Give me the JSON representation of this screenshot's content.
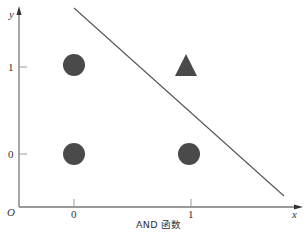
{
  "title": "AND 函数",
  "axes": {
    "x_label": "x",
    "y_label": "y",
    "origin_label": "O",
    "x_ticks": [
      "0",
      "1"
    ],
    "y_ticks": [
      "0",
      "1"
    ]
  },
  "points": [
    {
      "x": 0,
      "y": 0,
      "output": 0,
      "marker": "circle"
    },
    {
      "x": 0,
      "y": 1,
      "output": 0,
      "marker": "circle"
    },
    {
      "x": 1,
      "y": 0,
      "output": 0,
      "marker": "circle"
    },
    {
      "x": 1,
      "y": 1,
      "output": 1,
      "marker": "triangle"
    }
  ],
  "decision_boundary": {
    "description": "straight line separating (1,1) from other points",
    "color": "#555555"
  },
  "colors": {
    "marker": "#4a4a4a",
    "axis": "#666666",
    "line": "#555555"
  }
}
